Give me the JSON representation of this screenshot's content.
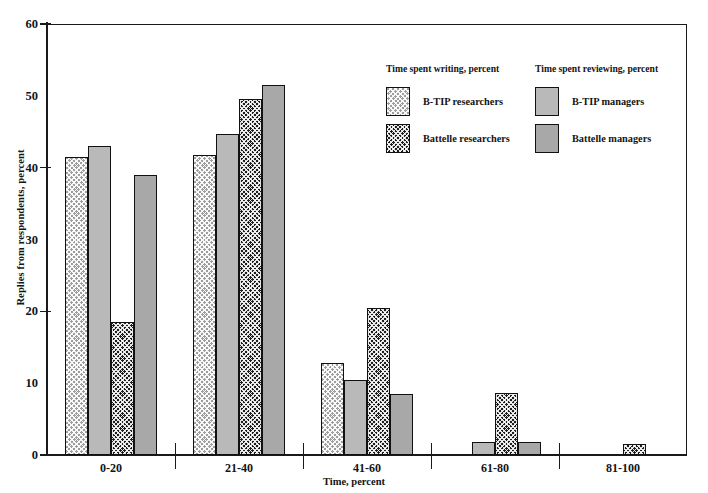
{
  "chart_data": {
    "type": "bar",
    "title": "",
    "xlabel": "Time, percent",
    "ylabel": "Replies from respondents, percent",
    "categories": [
      "0-20",
      "21-40",
      "41-60",
      "61-80",
      "81-100"
    ],
    "ylim": [
      0,
      60
    ],
    "yticks": [
      0,
      10,
      20,
      30,
      40,
      50,
      60
    ],
    "grid": false,
    "legend_position": "upper right inside plot",
    "legend_groups": [
      {
        "heading": "Time spent writing, percent",
        "series": [
          "B-TIP researchers",
          "Battelle researchers"
        ]
      },
      {
        "heading": "Time spent reviewing, percent",
        "series": [
          "B-TIP managers",
          "Battelle managers"
        ]
      }
    ],
    "series": [
      {
        "name": "B-TIP researchers",
        "pattern": "hatch-light",
        "values": [
          41.5,
          41.8,
          12.8,
          0,
          0
        ]
      },
      {
        "name": "B-TIP managers",
        "pattern": "solid-light",
        "values": [
          43.0,
          44.7,
          10.5,
          1.8,
          0
        ]
      },
      {
        "name": "Battelle researchers",
        "pattern": "hatch-dark",
        "values": [
          18.5,
          49.5,
          20.5,
          8.7,
          1.5
        ]
      },
      {
        "name": "Battelle managers",
        "pattern": "solid-dark",
        "values": [
          39.0,
          51.5,
          8.5,
          1.8,
          0
        ]
      }
    ]
  },
  "colors": {
    "hatch_light": "#9d9d9d",
    "solid_light": "#b9b9b9",
    "hatch_dark": "#1e1e1e",
    "solid_dark": "#a8a8a8",
    "axis": "#1a1a1a"
  }
}
